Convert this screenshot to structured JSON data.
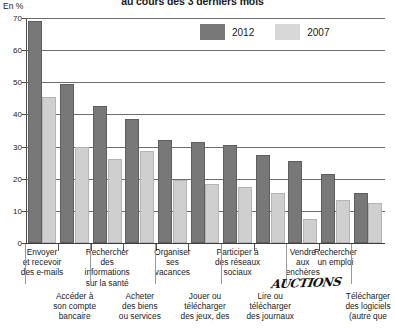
{
  "title": "au cours des 3 derniers mois",
  "unit_label": "En %",
  "annotation": "AUCTIONS",
  "legend": {
    "series_1_label": "2012",
    "series_2_label": "2007",
    "series_1_color": "#787878",
    "series_2_color": "#d8d8d8"
  },
  "chart_data": {
    "type": "bar",
    "title": "au cours des 3 derniers mois",
    "xlabel": "",
    "ylabel": "En %",
    "ylim": [
      0,
      70
    ],
    "yticks": [
      0,
      10,
      20,
      30,
      40,
      50,
      60,
      70
    ],
    "grid": true,
    "legend_position": "top-right",
    "categories": [
      "Envoyer et recevoir des e-mails",
      "Accéder à son compte bancaire",
      "Rechercher des informations sur la santé",
      "Acheter des biens ou services",
      "Organiser ses vacances",
      "Jouer ou télécharger des jeux, des",
      "Participer à des réseaux sociaux",
      "Lire ou télécharger des journaux",
      "Vendre aux enchères",
      "Rechercher un emploi",
      "Télécharger des logiciels (autre que"
    ],
    "series": [
      {
        "name": "2012",
        "color": "#787878",
        "values": [
          69,
          49.5,
          42.5,
          38.5,
          32,
          31.5,
          30.5,
          27.5,
          25.5,
          21.5,
          15.5
        ]
      },
      {
        "name": "2007",
        "color": "#d8d8d8",
        "values": [
          45.5,
          30,
          26,
          28.5,
          19.5,
          18.5,
          17.5,
          15.5,
          7.5,
          13.5,
          12.5
        ]
      }
    ]
  },
  "category_labels": [
    {
      "lines": [
        "Envoyer",
        "et recevoir",
        "des e-mails"
      ],
      "row": "top"
    },
    {
      "lines": [
        "Accéder à",
        "son compte",
        "bancaire"
      ],
      "row": "bot"
    },
    {
      "lines": [
        "Rechercher",
        "des",
        "informations",
        "sur la santé"
      ],
      "row": "top"
    },
    {
      "lines": [
        "Acheter",
        "des biens",
        "ou services"
      ],
      "row": "bot"
    },
    {
      "lines": [
        "Organiser",
        "ses",
        "vacances"
      ],
      "row": "top"
    },
    {
      "lines": [
        "Jouer ou",
        "télécharger",
        "des jeux, des"
      ],
      "row": "bot"
    },
    {
      "lines": [
        "Participer à",
        "des réseaux",
        "sociaux"
      ],
      "row": "top"
    },
    {
      "lines": [
        "Lire ou",
        "télécharger",
        "des journaux"
      ],
      "row": "bot"
    },
    {
      "lines": [
        "Vendre",
        "aux",
        "enchères"
      ],
      "row": "top"
    },
    {
      "lines": [
        "Rechercher",
        "un emploi"
      ],
      "row": "top"
    },
    {
      "lines": [
        "Télécharger",
        "des logiciels",
        "(autre que"
      ],
      "row": "bot"
    }
  ]
}
